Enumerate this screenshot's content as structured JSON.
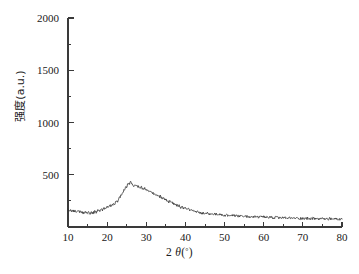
{
  "figure": {
    "background_color": "#ffffff",
    "line_color": "#2b2b2b",
    "axis_color": "#3a3a3a"
  },
  "axes": {
    "x_title_prefix": "2",
    "x_title_theta": "θ",
    "x_title_paren_open": "(",
    "x_title_degree": "°",
    "x_title_paren_close": ")",
    "y_title": "强度(a.u.)",
    "x_tick_labels": [
      "10",
      "20",
      "30",
      "40",
      "50",
      "60",
      "70",
      "80"
    ],
    "y_tick_labels": [
      "500",
      "1000",
      "1500",
      "2000"
    ]
  },
  "chart_data": {
    "type": "line",
    "title": "",
    "xlabel": "2θ(°)",
    "ylabel": "强度(a.u.)",
    "xlim": [
      10,
      80
    ],
    "ylim": [
      0,
      2000
    ],
    "x_major_ticks": [
      10,
      20,
      30,
      40,
      50,
      60,
      70,
      80
    ],
    "x_minor_ticks": [
      15,
      25,
      35,
      45,
      55,
      65,
      75
    ],
    "y_major_ticks": [
      500,
      1000,
      1500,
      2000
    ],
    "y_minor_ticks": [
      250,
      750,
      1250,
      1750
    ],
    "grid": false,
    "legend": null,
    "legend_position": "none",
    "annotations": [],
    "series": [
      {
        "name": "XRD intensity",
        "color": "#2b2b2b",
        "peak_center_2theta": 23,
        "peak_height": 425,
        "x": [
          10.0,
          10.4,
          10.8,
          11.2,
          11.6,
          12.0,
          12.4,
          12.8,
          13.2,
          13.6,
          14.0,
          14.4,
          14.8,
          15.2,
          15.6,
          16.0,
          16.4,
          16.8,
          17.2,
          17.6,
          18.0,
          18.4,
          18.8,
          19.2,
          19.6,
          20.0,
          20.4,
          20.8,
          21.2,
          21.6,
          22.0,
          22.4,
          22.8,
          23.2,
          23.6,
          24.0,
          24.4,
          24.8,
          25.2,
          25.6,
          26.0,
          26.4,
          26.8,
          27.2,
          27.6,
          28.0,
          28.4,
          28.8,
          29.2,
          29.6,
          30.0,
          30.4,
          30.8,
          31.2,
          31.6,
          32.0,
          32.4,
          32.8,
          33.2,
          33.6,
          34.0,
          34.4,
          34.8,
          35.2,
          35.6,
          36.0,
          36.4,
          36.8,
          37.2,
          37.6,
          38.0,
          38.4,
          38.8,
          39.2,
          39.6,
          40.0,
          40.4,
          40.8,
          41.2,
          41.6,
          42.0,
          42.4,
          42.8,
          43.2,
          43.6,
          44.0,
          44.4,
          44.8,
          45.2,
          45.6,
          46.0,
          46.4,
          46.8,
          47.2,
          47.6,
          48.0,
          48.4,
          48.8,
          49.2,
          49.6,
          50.0,
          50.4,
          50.8,
          51.2,
          51.6,
          52.0,
          52.4,
          52.8,
          53.2,
          53.6,
          54.0,
          54.4,
          54.8,
          55.2,
          55.6,
          56.0,
          56.4,
          56.8,
          57.2,
          57.6,
          58.0,
          58.4,
          58.8,
          59.2,
          59.6,
          60.0,
          60.4,
          60.8,
          61.2,
          61.6,
          62.0,
          62.4,
          62.8,
          63.2,
          63.6,
          64.0,
          64.4,
          64.8,
          65.2,
          65.6,
          66.0,
          66.4,
          66.8,
          67.2,
          67.6,
          68.0,
          68.4,
          68.8,
          69.2,
          69.6,
          70.0,
          70.4,
          70.8,
          71.2,
          71.6,
          72.0,
          72.4,
          72.8,
          73.2,
          73.6,
          74.0,
          74.4,
          74.8,
          75.2,
          75.6,
          76.0,
          76.4,
          76.8,
          77.2,
          77.6,
          78.0,
          78.4,
          78.8,
          79.2,
          79.6,
          80.0
        ],
        "y": [
          163,
          150,
          158,
          147,
          155,
          143,
          152,
          141,
          149,
          138,
          132,
          144,
          130,
          139,
          128,
          141,
          133,
          148,
          140,
          156,
          149,
          165,
          158,
          176,
          170,
          190,
          183,
          206,
          200,
          228,
          222,
          253,
          248,
          286,
          300,
          332,
          355,
          380,
          400,
          415,
          425,
          412,
          398,
          400,
          385,
          390,
          372,
          378,
          360,
          366,
          348,
          352,
          335,
          338,
          320,
          322,
          305,
          308,
          290,
          292,
          274,
          276,
          258,
          260,
          242,
          244,
          228,
          229,
          214,
          215,
          200,
          201,
          188,
          190,
          176,
          178,
          166,
          168,
          157,
          159,
          149,
          151,
          142,
          144,
          136,
          138,
          131,
          133,
          127,
          129,
          123,
          125,
          120,
          128,
          118,
          122,
          115,
          119,
          113,
          116,
          110,
          114,
          108,
          112,
          106,
          110,
          104,
          108,
          103,
          106,
          101,
          105,
          100,
          103,
          98,
          102,
          97,
          100,
          96,
          99,
          94,
          98,
          93,
          96,
          92,
          95,
          91,
          94,
          90,
          93,
          89,
          92,
          88,
          91,
          87,
          90,
          86,
          89,
          85,
          88,
          84,
          87,
          84,
          86,
          83,
          86,
          82,
          85,
          82,
          84,
          81,
          84,
          80,
          83,
          80,
          82,
          79,
          82,
          78,
          81,
          78,
          80,
          77,
          80,
          77,
          79,
          76,
          79,
          75,
          78,
          75,
          77,
          74,
          77,
          74,
          76
        ]
      }
    ]
  }
}
